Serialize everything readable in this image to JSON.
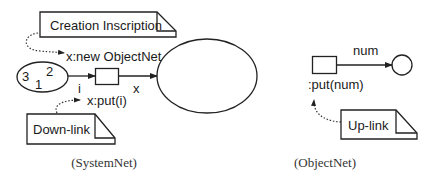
{
  "system_net": {
    "caption": "(SystemNet)",
    "creation_note": {
      "label": "Creation Inscription"
    },
    "creation_inscription": "x:new ObjectNet",
    "downlink_note": {
      "label": "Down-link"
    },
    "downlink_inscription": "x:put(i)",
    "place_tokens": [
      "3",
      "2",
      "1"
    ],
    "arc_in_label": "i",
    "arc_out_label": "x"
  },
  "object_net": {
    "caption": "(ObjectNet)",
    "arc_label": "num",
    "transition_inscription": ":put(num)",
    "uplink_note": {
      "label": "Up-link"
    }
  },
  "colors": {
    "stroke": "#222222",
    "background": "#ffffff"
  }
}
